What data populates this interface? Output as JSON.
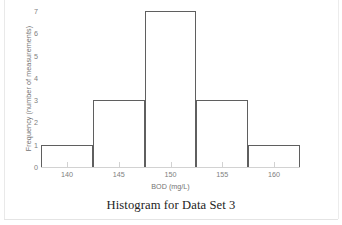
{
  "chart_data": {
    "type": "bar",
    "title": "Histogram for Data Set 3",
    "xlabel": "BOD (mg/L)",
    "ylabel": "Frequency (number of measurements)",
    "categories": [
      "137.5-142.5",
      "142.5-147.5",
      "147.5-152.5",
      "152.5-157.5",
      "157.5-162.5"
    ],
    "bin_edges": [
      137.5,
      142.5,
      147.5,
      152.5,
      157.5,
      162.5
    ],
    "bin_centers": [
      140,
      145,
      150,
      155,
      160
    ],
    "values": [
      1,
      3,
      7,
      3,
      1
    ],
    "xlim": [
      137.5,
      162.5
    ],
    "ylim": [
      0,
      7
    ],
    "xticks": [
      140,
      145,
      150,
      155,
      160
    ],
    "xtick_labels": [
      "140",
      "145",
      "150",
      "155",
      "160"
    ],
    "yticks": [
      0,
      1,
      2,
      3,
      4,
      5,
      6,
      7
    ],
    "ytick_labels": [
      "0",
      "1",
      "2",
      "3",
      "4",
      "5",
      "6",
      "7"
    ],
    "grid": false,
    "legend": false,
    "bar_fill_color": "#ffffff",
    "bar_outline_color": "#5f5f5f",
    "axis_color": "#d2d2d2",
    "tick_label_color": "#808080",
    "axis_title_color": "#737373",
    "title_color": "#232323"
  }
}
